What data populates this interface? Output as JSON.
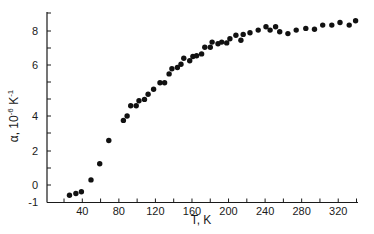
{
  "chart_data": {
    "type": "scatter",
    "title": "",
    "xlabel": "T, K",
    "ylabel": "α, 10⁻⁶ K⁻¹",
    "ylabel_parts": {
      "alpha": "α, 10",
      "exp1": "-6",
      "unit": " K",
      "exp2": "-1"
    },
    "xlim": [
      0,
      345
    ],
    "ylim": [
      -1,
      9
    ],
    "grid": false,
    "legend": null,
    "x_ticks": [
      20,
      40,
      60,
      80,
      100,
      120,
      140,
      160,
      180,
      200,
      220,
      240,
      260,
      280,
      300,
      320,
      340
    ],
    "x_tick_labels": [
      "40",
      "80",
      "120",
      "160",
      "200",
      "240",
      "280",
      "320"
    ],
    "x_tick_label_values": [
      40,
      80,
      120,
      160,
      200,
      240,
      280,
      320
    ],
    "y_tick_labels": [
      "8",
      "6",
      "4",
      "2",
      "0",
      "-1"
    ],
    "series": [
      {
        "name": "alpha",
        "marker": "filled-circle",
        "color": "#111111",
        "x": [
          26,
          33,
          39,
          49.5,
          59,
          69,
          85,
          89,
          93,
          99,
          102,
          108,
          112,
          118,
          125,
          130,
          135,
          138,
          144,
          148,
          151,
          157.5,
          161,
          165,
          170.5,
          174,
          180,
          182,
          188.5,
          192.5,
          198,
          201.5,
          208,
          213.5,
          216,
          223.5,
          232.5,
          241,
          245.5,
          251.5,
          256,
          265,
          274,
          284.5,
          294,
          303,
          313,
          322,
          332,
          339
        ],
        "y": [
          -0.6,
          -0.5,
          -0.4,
          0.3,
          1.25,
          2.6,
          3.75,
          4.0,
          4.4,
          4.4,
          4.6,
          4.65,
          4.85,
          5.05,
          5.3,
          5.3,
          5.65,
          5.85,
          5.9,
          6.05,
          6.4,
          6.25,
          6.5,
          6.55,
          6.65,
          7.05,
          7.05,
          7.35,
          7.25,
          7.35,
          7.3,
          7.55,
          7.75,
          7.45,
          7.8,
          7.9,
          8.05,
          8.25,
          8.05,
          8.25,
          7.95,
          7.85,
          8.05,
          8.15,
          8.1,
          8.35,
          8.35,
          8.5,
          8.35,
          8.6
        ]
      }
    ]
  }
}
